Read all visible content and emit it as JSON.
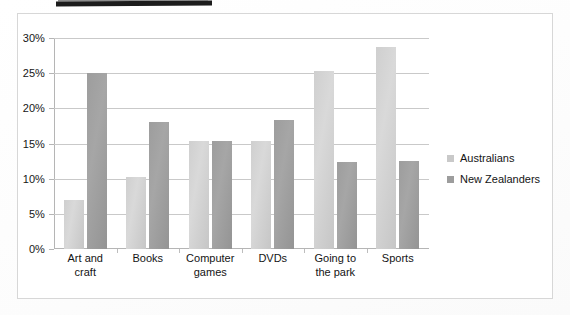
{
  "chart_data": {
    "type": "bar",
    "title": "",
    "xlabel": "",
    "ylabel": "",
    "ylim": [
      0,
      30
    ],
    "ytick_labels": [
      "0%",
      "5%",
      "10%",
      "15%",
      "20%",
      "25%",
      "30%"
    ],
    "ytick_values": [
      0,
      5,
      10,
      15,
      20,
      25,
      30
    ],
    "grid": true,
    "legend_position": "right",
    "categories": [
      "Art and\ncraft",
      "Books",
      "Computer\ngames",
      "DVDs",
      "Going to\nthe park",
      "Sports"
    ],
    "series": [
      {
        "name": "Australians",
        "color": "#cfcfcf",
        "values": [
          7.0,
          10.2,
          15.3,
          15.3,
          25.3,
          28.7
        ]
      },
      {
        "name": "New Zealanders",
        "color": "#9d9d9d",
        "values": [
          25.0,
          18.0,
          15.3,
          18.3,
          12.4,
          12.5
        ]
      }
    ]
  },
  "legend": {
    "items": [
      {
        "label": "Australians",
        "swatch": "light"
      },
      {
        "label": "New Zealanders",
        "swatch": "dark"
      }
    ]
  },
  "heading": {
    "text": ""
  }
}
